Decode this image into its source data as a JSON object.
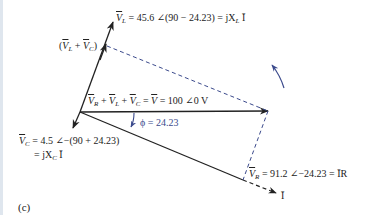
{
  "figure": {
    "panel_label": "(c)",
    "labels": {
      "vl": {
        "symbol": "V",
        "sub": "L",
        "expr": " = 45.6 ∠(90 − 24.23) = jX",
        "sub2": "L",
        "tail": " Ī"
      },
      "vlvc": {
        "pre": "(",
        "s1": "V",
        "sub1": "L",
        "mid": " + ",
        "s2": "V",
        "sub2": "C",
        "post": ")"
      },
      "sum": {
        "s1": "V",
        "sub1": "R",
        "p1": " + ",
        "s2": "V",
        "sub2": "L",
        "p2": " + ",
        "s3": "V",
        "sub3": "C",
        "eq": " = ",
        "s4": "V",
        "rest": " = 100 ∠0  V"
      },
      "phi": "ϕ = 24.23",
      "vc_line1": {
        "symbol": "V",
        "sub": "C",
        "expr": " = 4.5 ∠−(90  + 24.23)"
      },
      "vc_line2": {
        "expr": "= jX",
        "sub": "C",
        "tail": " Ī"
      },
      "vr": {
        "symbol": "V",
        "sub": "R",
        "expr": " = 91.2 ∠−24.23  = ĪR"
      },
      "i": "Ī"
    },
    "phasors": [
      {
        "name": "V_L",
        "magnitude": 45.6,
        "angle_deg": 65.77
      },
      {
        "name": "V_C",
        "magnitude": 4.5,
        "angle_deg": -114.23
      },
      {
        "name": "V_R",
        "magnitude": 91.2,
        "angle_deg": -24.23
      },
      {
        "name": "V",
        "magnitude": 100,
        "angle_deg": 0
      },
      {
        "name": "I",
        "angle_deg": -24.23
      }
    ],
    "phi_deg": 24.23,
    "colors": {
      "line": "#222222",
      "accent": "#3b4a8c",
      "dashed": "#3b4a8c"
    }
  }
}
